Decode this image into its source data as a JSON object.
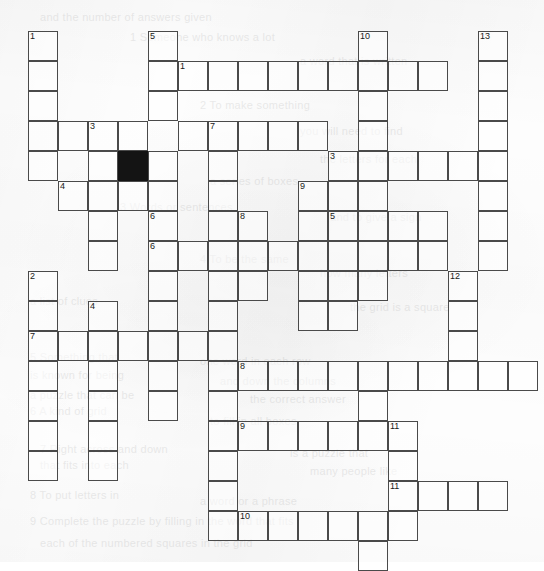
{
  "puzzle": {
    "title": "Crossword Grid",
    "type": "crossword",
    "cell_size": 30,
    "origin_x": 28,
    "origin_y": 31,
    "columns": 17,
    "rows": 18,
    "colors": {
      "grid_line": "#4a4a4a",
      "block_fill": "#141414",
      "cell_fill": "#ffffff",
      "page_background": "#fdfdfd",
      "number_text": "#1a1a1a"
    },
    "cells": [
      {
        "c": 0,
        "r": 0,
        "num": "1"
      },
      {
        "c": 0,
        "r": 1
      },
      {
        "c": 0,
        "r": 2
      },
      {
        "c": 0,
        "r": 3
      },
      {
        "c": 0,
        "r": 4
      },
      {
        "c": 4,
        "r": 0,
        "num": "5"
      },
      {
        "c": 4,
        "r": 1
      },
      {
        "c": 4,
        "r": 2
      },
      {
        "c": 11,
        "r": 0,
        "num": "10"
      },
      {
        "c": 11,
        "r": 1
      },
      {
        "c": 11,
        "r": 2
      },
      {
        "c": 11,
        "r": 3
      },
      {
        "c": 11,
        "r": 4
      },
      {
        "c": 11,
        "r": 5
      },
      {
        "c": 11,
        "r": 6
      },
      {
        "c": 11,
        "r": 7
      },
      {
        "c": 11,
        "r": 8
      },
      {
        "c": 15,
        "r": 0,
        "num": "13"
      },
      {
        "c": 15,
        "r": 1
      },
      {
        "c": 15,
        "r": 2
      },
      {
        "c": 15,
        "r": 3
      },
      {
        "c": 15,
        "r": 4
      },
      {
        "c": 15,
        "r": 5
      },
      {
        "c": 15,
        "r": 6
      },
      {
        "c": 15,
        "r": 7
      },
      {
        "c": 5,
        "r": 1,
        "num": "1"
      },
      {
        "c": 6,
        "r": 1
      },
      {
        "c": 7,
        "r": 1
      },
      {
        "c": 8,
        "r": 1
      },
      {
        "c": 9,
        "r": 1
      },
      {
        "c": 10,
        "r": 1
      },
      {
        "c": 12,
        "r": 1
      },
      {
        "c": 13,
        "r": 1
      },
      {
        "c": 1,
        "r": 3
      },
      {
        "c": 2,
        "r": 3,
        "num": "3"
      },
      {
        "c": 3,
        "r": 3
      },
      {
        "c": 5,
        "r": 3
      },
      {
        "c": 6,
        "r": 3,
        "num": "7"
      },
      {
        "c": 7,
        "r": 3
      },
      {
        "c": 8,
        "r": 3
      },
      {
        "c": 9,
        "r": 3
      },
      {
        "c": 2,
        "r": 4
      },
      {
        "c": 3,
        "r": 4,
        "black": true
      },
      {
        "c": 4,
        "r": 4
      },
      {
        "c": 6,
        "r": 4
      },
      {
        "c": 10,
        "r": 4,
        "num": "3"
      },
      {
        "c": 12,
        "r": 4
      },
      {
        "c": 13,
        "r": 4
      },
      {
        "c": 14,
        "r": 4
      },
      {
        "c": 1,
        "r": 5,
        "num": "4"
      },
      {
        "c": 2,
        "r": 5
      },
      {
        "c": 3,
        "r": 5
      },
      {
        "c": 4,
        "r": 5
      },
      {
        "c": 6,
        "r": 5
      },
      {
        "c": 9,
        "r": 5,
        "num": "9"
      },
      {
        "c": 10,
        "r": 5
      },
      {
        "c": 2,
        "r": 6
      },
      {
        "c": 4,
        "r": 6,
        "num": "6"
      },
      {
        "c": 6,
        "r": 6
      },
      {
        "c": 7,
        "r": 6,
        "num": "8"
      },
      {
        "c": 9,
        "r": 6
      },
      {
        "c": 10,
        "r": 6,
        "num": "5"
      },
      {
        "c": 12,
        "r": 6
      },
      {
        "c": 13,
        "r": 6
      },
      {
        "c": 2,
        "r": 7
      },
      {
        "c": 4,
        "r": 7,
        "num": "6"
      },
      {
        "c": 5,
        "r": 7
      },
      {
        "c": 6,
        "r": 7
      },
      {
        "c": 7,
        "r": 7
      },
      {
        "c": 8,
        "r": 7
      },
      {
        "c": 9,
        "r": 7
      },
      {
        "c": 10,
        "r": 7
      },
      {
        "c": 12,
        "r": 7
      },
      {
        "c": 13,
        "r": 7
      },
      {
        "c": 4,
        "r": 8
      },
      {
        "c": 6,
        "r": 8
      },
      {
        "c": 7,
        "r": 8
      },
      {
        "c": 9,
        "r": 8
      },
      {
        "c": 10,
        "r": 8
      },
      {
        "c": 14,
        "r": 8,
        "num": "12"
      },
      {
        "c": 0,
        "r": 8,
        "num": "2"
      },
      {
        "c": 0,
        "r": 9
      },
      {
        "c": 0,
        "r": 10,
        "num": "7"
      },
      {
        "c": 0,
        "r": 11
      },
      {
        "c": 0,
        "r": 12
      },
      {
        "c": 0,
        "r": 13
      },
      {
        "c": 0,
        "r": 14
      },
      {
        "c": 2,
        "r": 9,
        "num": "4"
      },
      {
        "c": 2,
        "r": 10
      },
      {
        "c": 2,
        "r": 11
      },
      {
        "c": 2,
        "r": 12
      },
      {
        "c": 2,
        "r": 13
      },
      {
        "c": 2,
        "r": 14
      },
      {
        "c": 4,
        "r": 9
      },
      {
        "c": 4,
        "r": 10
      },
      {
        "c": 4,
        "r": 11
      },
      {
        "c": 4,
        "r": 12
      },
      {
        "c": 6,
        "r": 9
      },
      {
        "c": 6,
        "r": 10
      },
      {
        "c": 6,
        "r": 11
      },
      {
        "c": 6,
        "r": 12
      },
      {
        "c": 6,
        "r": 13
      },
      {
        "c": 6,
        "r": 14
      },
      {
        "c": 1,
        "r": 10
      },
      {
        "c": 3,
        "r": 10
      },
      {
        "c": 5,
        "r": 10
      },
      {
        "c": 9,
        "r": 9
      },
      {
        "c": 10,
        "r": 9
      },
      {
        "c": 14,
        "r": 9
      },
      {
        "c": 14,
        "r": 10
      },
      {
        "c": 14,
        "r": 11
      },
      {
        "c": 7,
        "r": 11,
        "num": "8"
      },
      {
        "c": 8,
        "r": 11
      },
      {
        "c": 9,
        "r": 11
      },
      {
        "c": 10,
        "r": 11
      },
      {
        "c": 11,
        "r": 11
      },
      {
        "c": 12,
        "r": 11
      },
      {
        "c": 13,
        "r": 11
      },
      {
        "c": 14,
        "r": 11,
        "dup": true
      },
      {
        "c": 15,
        "r": 11
      },
      {
        "c": 16,
        "r": 11
      },
      {
        "c": 11,
        "r": 12
      },
      {
        "c": 7,
        "r": 13,
        "num": "9"
      },
      {
        "c": 8,
        "r": 13
      },
      {
        "c": 9,
        "r": 13
      },
      {
        "c": 10,
        "r": 13
      },
      {
        "c": 11,
        "r": 13
      },
      {
        "c": 12,
        "r": 13,
        "num": "11"
      },
      {
        "c": 12,
        "r": 14
      },
      {
        "c": 12,
        "r": 15,
        "num": "11"
      },
      {
        "c": 13,
        "r": 15
      },
      {
        "c": 14,
        "r": 15
      },
      {
        "c": 15,
        "r": 15
      },
      {
        "c": 12,
        "r": 16
      },
      {
        "c": 6,
        "r": 15
      },
      {
        "c": 6,
        "r": 16
      },
      {
        "c": 7,
        "r": 16,
        "num": "10"
      },
      {
        "c": 8,
        "r": 16
      },
      {
        "c": 9,
        "r": 16
      },
      {
        "c": 10,
        "r": 16
      },
      {
        "c": 11,
        "r": 16
      },
      {
        "c": 11,
        "r": 17
      }
    ],
    "ghost_lines": [
      {
        "x": 40,
        "y": 8,
        "text": "and the number of answers given"
      },
      {
        "x": 130,
        "y": 28,
        "text": "1  Someone who knows a lot"
      },
      {
        "x": 300,
        "y": 52,
        "text": "a word that is written"
      },
      {
        "x": 200,
        "y": 96,
        "text": "2  To make something"
      },
      {
        "x": 300,
        "y": 122,
        "text": "you will need to find"
      },
      {
        "x": 320,
        "y": 150,
        "text": "the letters for each"
      },
      {
        "x": 210,
        "y": 172,
        "text": "a series of boxes"
      },
      {
        "x": 120,
        "y": 198,
        "text": "3  Words or sentences"
      },
      {
        "x": 330,
        "y": 208,
        "text": "and to give a sign"
      },
      {
        "x": 200,
        "y": 250,
        "text": "4  To be the same"
      },
      {
        "x": 320,
        "y": 264,
        "text": "how many letters"
      },
      {
        "x": 30,
        "y": 292,
        "text": "a list of clues"
      },
      {
        "x": 350,
        "y": 298,
        "text": "the grid is a square"
      },
      {
        "x": 30,
        "y": 348,
        "text": "5  Something that"
      },
      {
        "x": 200,
        "y": 352,
        "text": "one word in each row"
      },
      {
        "x": 30,
        "y": 366,
        "text": "is known for being"
      },
      {
        "x": 220,
        "y": 372,
        "text": "and down the columns"
      },
      {
        "x": 30,
        "y": 386,
        "text": "a puzzle that can be"
      },
      {
        "x": 250,
        "y": 390,
        "text": "the correct answer"
      },
      {
        "x": 30,
        "y": 402,
        "text": "6  A kind of grid"
      },
      {
        "x": 210,
        "y": 412,
        "text": "to fill in all boxes"
      },
      {
        "x": 40,
        "y": 440,
        "text": "7  Right across and down"
      },
      {
        "x": 290,
        "y": 444,
        "text": "is a puzzle that"
      },
      {
        "x": 40,
        "y": 456,
        "text": "that fits into each"
      },
      {
        "x": 310,
        "y": 462,
        "text": "many people like"
      },
      {
        "x": 30,
        "y": 486,
        "text": "8  To put letters in"
      },
      {
        "x": 200,
        "y": 492,
        "text": "a word or a phrase"
      },
      {
        "x": 30,
        "y": 512,
        "text": "9  Complete the puzzle by filling in the word that fits"
      },
      {
        "x": 40,
        "y": 534,
        "text": "each of the numbered squares in the grid"
      }
    ]
  }
}
